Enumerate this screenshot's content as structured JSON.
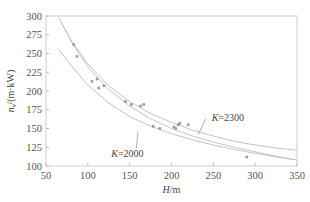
{
  "chart_data": {
    "type": "scatter",
    "title": "",
    "xlabel": "H/m",
    "ylabel": "n_s/(m·kW)",
    "xlim": [
      50,
      350
    ],
    "ylim": [
      100,
      300
    ],
    "xticks": [
      50,
      100,
      150,
      200,
      250,
      300,
      350
    ],
    "yticks": [
      100,
      125,
      150,
      175,
      200,
      225,
      250,
      275,
      300
    ],
    "grid": false,
    "points": [
      {
        "x": 83,
        "y": 262
      },
      {
        "x": 87,
        "y": 246
      },
      {
        "x": 105,
        "y": 213
      },
      {
        "x": 111,
        "y": 216
      },
      {
        "x": 113,
        "y": 204
      },
      {
        "x": 119,
        "y": 207
      },
      {
        "x": 145,
        "y": 186
      },
      {
        "x": 152,
        "y": 182
      },
      {
        "x": 163,
        "y": 180
      },
      {
        "x": 167,
        "y": 182
      },
      {
        "x": 178,
        "y": 153
      },
      {
        "x": 186,
        "y": 150
      },
      {
        "x": 203,
        "y": 152
      },
      {
        "x": 205,
        "y": 150
      },
      {
        "x": 208,
        "y": 155
      },
      {
        "x": 210,
        "y": 157
      },
      {
        "x": 220,
        "y": 155
      },
      {
        "x": 290,
        "y": 112
      }
    ],
    "series": [
      {
        "name": "K=2300",
        "type": "line",
        "x": [
          65,
          80,
          100,
          125,
          150,
          175,
          200,
          225,
          250,
          275,
          300,
          325,
          350
        ],
        "y": [
          298,
          268,
          236,
          207,
          186,
          170,
          158,
          148,
          140,
          133,
          128,
          124,
          121
        ]
      },
      {
        "name": "middle",
        "type": "line",
        "x": [
          68,
          80,
          100,
          125,
          150,
          175,
          200,
          225,
          250,
          275,
          300,
          325,
          350
        ],
        "y": [
          292,
          266,
          232,
          202,
          180,
          163,
          150,
          140,
          132,
          125,
          119,
          113,
          108
        ]
      },
      {
        "name": "K=2000",
        "type": "line",
        "x": [
          65,
          80,
          100,
          125,
          150,
          175,
          200,
          225,
          250,
          275,
          300,
          325,
          350
        ],
        "y": [
          256,
          234,
          208,
          184,
          166,
          153,
          143,
          135,
          128,
          122,
          117,
          112,
          108
        ]
      }
    ],
    "annotations": [
      {
        "text": "K=2300",
        "x": 248,
        "y": 165
      },
      {
        "text": "K=2000",
        "x": 165,
        "y": 122
      }
    ]
  },
  "labels": {
    "xlabel_main": "H",
    "xlabel_unit": "/m",
    "ylabel_main": "n",
    "ylabel_sub": "s",
    "ylabel_unit": "/(m·kW)",
    "k2300": "K=2300",
    "k2000": "K=2000"
  }
}
